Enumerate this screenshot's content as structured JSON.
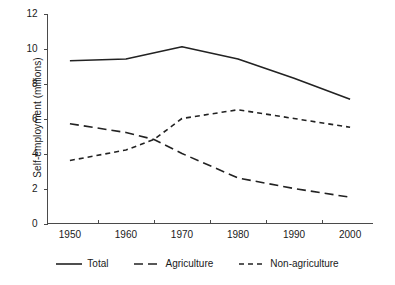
{
  "chart_data": {
    "type": "line",
    "title": "",
    "xlabel": "",
    "ylabel": "Self-employment (millions)",
    "x": [
      1950,
      1960,
      1965,
      1970,
      1980,
      1990,
      2000
    ],
    "xlim": [
      1946,
      2004
    ],
    "ylim": [
      0,
      12
    ],
    "xticklabels": [
      "1950",
      "1960",
      "1970",
      "1980",
      "1990",
      "2000"
    ],
    "yticklabels": [
      "0",
      "2",
      "4",
      "6",
      "8",
      "10",
      "12"
    ],
    "grid": false,
    "legend_position": "bottom",
    "series": [
      {
        "name": "Total",
        "style": "solid",
        "color": "#222222",
        "x": [
          1950,
          1960,
          1970,
          1980,
          1990,
          2000
        ],
        "values": [
          9.3,
          9.4,
          10.1,
          9.4,
          8.3,
          7.1
        ]
      },
      {
        "name": "Agriculture",
        "style": "long-dash",
        "color": "#222222",
        "x": [
          1950,
          1960,
          1965,
          1970,
          1980,
          1990,
          2000
        ],
        "values": [
          5.7,
          5.2,
          4.8,
          4.0,
          2.6,
          2.0,
          1.5
        ]
      },
      {
        "name": "Non-agriculture",
        "style": "short-dash",
        "color": "#222222",
        "x": [
          1950,
          1960,
          1965,
          1970,
          1980,
          1990,
          2000
        ],
        "values": [
          3.6,
          4.2,
          4.8,
          6.0,
          6.5,
          6.0,
          5.5
        ]
      }
    ]
  },
  "axes": {
    "y_title": "Self-employment (millions)",
    "y_ticks": [
      {
        "label": "12",
        "value": 12
      },
      {
        "label": "10",
        "value": 10
      },
      {
        "label": "8",
        "value": 8
      },
      {
        "label": "6",
        "value": 6
      },
      {
        "label": "4",
        "value": 4
      },
      {
        "label": "2",
        "value": 2
      },
      {
        "label": "0",
        "value": 0
      }
    ],
    "x_ticks": [
      {
        "label": "1950",
        "value": 1950
      },
      {
        "label": "1960",
        "value": 1960
      },
      {
        "label": "1970",
        "value": 1970
      },
      {
        "label": "1980",
        "value": 1980
      },
      {
        "label": "1990",
        "value": 1990
      },
      {
        "label": "2000",
        "value": 2000
      }
    ]
  },
  "legend": {
    "items": [
      {
        "label": "Total",
        "style": "solid"
      },
      {
        "label": "Agriculture",
        "style": "long-dash"
      },
      {
        "label": "Non-agriculture",
        "style": "short-dash"
      }
    ]
  }
}
